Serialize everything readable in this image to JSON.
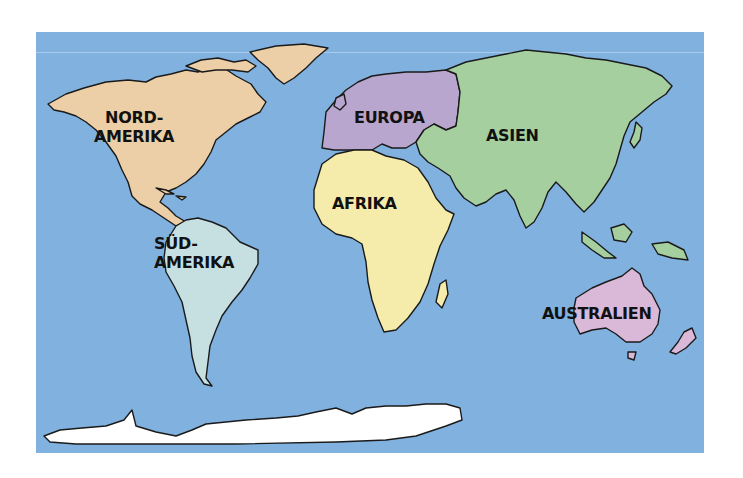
{
  "map": {
    "ocean_color": "#80b1df",
    "continents": [
      {
        "id": "north-america",
        "label_lines": [
          "NORD-",
          "AMERIKA"
        ],
        "color": "#eccfa6"
      },
      {
        "id": "south-america",
        "label_lines": [
          "SÜD-",
          "AMERIKA"
        ],
        "color": "#c6dfe0"
      },
      {
        "id": "europe",
        "label_lines": [
          "EUROPA"
        ],
        "color": "#b8a6cf"
      },
      {
        "id": "asia",
        "label_lines": [
          "ASIEN"
        ],
        "color": "#a6cf9f"
      },
      {
        "id": "africa",
        "label_lines": [
          "AFRIKA"
        ],
        "color": "#f5ebab"
      },
      {
        "id": "australia",
        "label_lines": [
          "AUSTRALIEN"
        ],
        "color": "#d9b8d8"
      },
      {
        "id": "antarctica",
        "label_lines": [],
        "color": "#ffffff"
      }
    ],
    "greenland_color": "#eccfa6"
  }
}
